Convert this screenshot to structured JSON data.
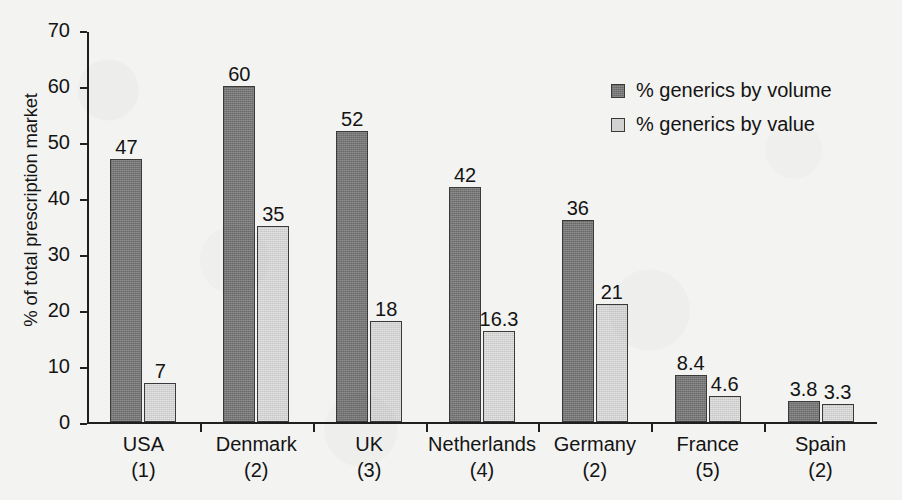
{
  "chart_data": {
    "type": "bar",
    "title": "",
    "xlabel": "",
    "ylabel": "% of total prescription market",
    "ylim": [
      0,
      70
    ],
    "ytick_step": 10,
    "yticks": [
      70,
      60,
      50,
      40,
      30,
      20,
      10,
      0
    ],
    "grid": false,
    "legend_position": "top-right",
    "categories": [
      "USA",
      "Denmark",
      "UK",
      "Netherlands",
      "Germany",
      "France",
      "Spain"
    ],
    "category_ranks": [
      "(1)",
      "(2)",
      "(3)",
      "(4)",
      "(2)",
      "(5)",
      "(2)"
    ],
    "series": [
      {
        "name": "% generics by volume",
        "color": "#767676",
        "values": [
          47,
          60,
          52,
          42,
          36,
          8.4,
          3.8
        ],
        "labels": [
          "47",
          "60",
          "52",
          "42",
          "36",
          "8.4",
          "3.8"
        ]
      },
      {
        "name": "% generics by value",
        "color": "#d2d2d2",
        "values": [
          7,
          35,
          18,
          16.3,
          21,
          4.6,
          3.3
        ],
        "labels": [
          "7",
          "35",
          "18",
          "16.3",
          "21",
          "4.6",
          "3.3"
        ]
      }
    ]
  },
  "legend": {
    "items": [
      {
        "label": "% generics by volume",
        "swatch": "volume"
      },
      {
        "label": "% generics by value",
        "swatch": "value"
      }
    ]
  },
  "axes": {
    "y_title": "% of total prescription market",
    "y_tick_labels": [
      "70",
      "60",
      "50",
      "40",
      "30",
      "20",
      "10",
      "0"
    ]
  }
}
